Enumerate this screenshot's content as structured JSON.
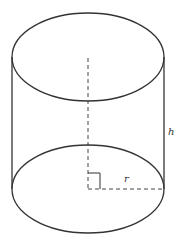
{
  "diagram": {
    "type": "cylinder",
    "labels": {
      "height": "h",
      "radius": "r"
    },
    "colors": {
      "stroke": "#333333",
      "dashed": "#444444",
      "background": "#ffffff"
    },
    "features": {
      "right_angle_marker": true,
      "axis_dashed": true,
      "radius_dashed": true
    }
  }
}
